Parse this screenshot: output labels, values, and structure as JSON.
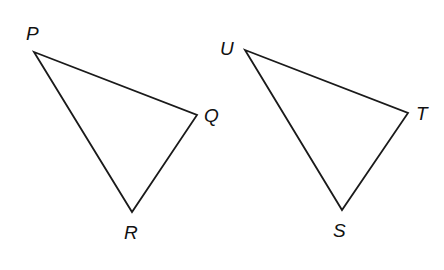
{
  "diagram": {
    "title": "",
    "triangles": [
      {
        "name": "PQR",
        "vertices": {
          "P": {
            "x": 34,
            "y": 52
          },
          "Q": {
            "x": 197,
            "y": 115
          },
          "R": {
            "x": 132,
            "y": 212
          }
        },
        "labels": {
          "P": {
            "text": "P",
            "x": 26,
            "y": 40
          },
          "Q": {
            "text": "Q",
            "x": 204,
            "y": 122
          },
          "R": {
            "text": "R",
            "x": 124,
            "y": 239
          }
        }
      },
      {
        "name": "UTS",
        "vertices": {
          "U": {
            "x": 245,
            "y": 50
          },
          "T": {
            "x": 408,
            "y": 113
          },
          "S": {
            "x": 342,
            "y": 210
          }
        },
        "labels": {
          "U": {
            "text": "U",
            "x": 220,
            "y": 55
          },
          "T": {
            "text": "T",
            "x": 416,
            "y": 120
          },
          "S": {
            "text": "S",
            "x": 333,
            "y": 237
          }
        }
      }
    ],
    "colors": {
      "stroke": "#1a1a1a",
      "label": "#111111",
      "background": "#ffffff"
    }
  }
}
